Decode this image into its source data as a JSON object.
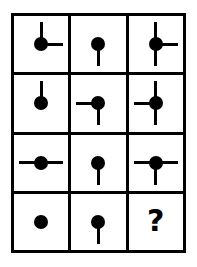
{
  "puzzle": {
    "type": "visual-analogy-matrix",
    "title": "Dot and line matrix puzzle",
    "rows": 4,
    "cols": 3,
    "border_color": "#000000",
    "background_color": "#ffffff",
    "stroke_color": "#000000",
    "missing_cell_symbol": "?",
    "cells": [
      {
        "id": "r1c1",
        "row": 1,
        "col": 1,
        "shape": "dot",
        "lines": [
          "up",
          "right"
        ],
        "label": ""
      },
      {
        "id": "r1c2",
        "row": 1,
        "col": 2,
        "shape": "dot",
        "lines": [
          "down"
        ],
        "label": ""
      },
      {
        "id": "r1c3",
        "row": 1,
        "col": 3,
        "shape": "dot",
        "lines": [
          "up",
          "down",
          "right"
        ],
        "label": ""
      },
      {
        "id": "r2c1",
        "row": 2,
        "col": 1,
        "shape": "dot",
        "lines": [
          "up"
        ],
        "label": ""
      },
      {
        "id": "r2c2",
        "row": 2,
        "col": 2,
        "shape": "dot",
        "lines": [
          "left",
          "down"
        ],
        "label": ""
      },
      {
        "id": "r2c3",
        "row": 2,
        "col": 3,
        "shape": "dot",
        "lines": [
          "up",
          "down",
          "left"
        ],
        "label": ""
      },
      {
        "id": "r3c1",
        "row": 3,
        "col": 1,
        "shape": "dot",
        "lines": [
          "left",
          "right"
        ],
        "label": ""
      },
      {
        "id": "r3c2",
        "row": 3,
        "col": 2,
        "shape": "dot",
        "lines": [
          "down"
        ],
        "label": ""
      },
      {
        "id": "r3c3",
        "row": 3,
        "col": 3,
        "shape": "dot",
        "lines": [
          "left",
          "right",
          "down"
        ],
        "label": ""
      },
      {
        "id": "r4c1",
        "row": 4,
        "col": 1,
        "shape": "dot",
        "lines": [],
        "label": ""
      },
      {
        "id": "r4c2",
        "row": 4,
        "col": 2,
        "shape": "dot",
        "lines": [
          "down"
        ],
        "label": ""
      },
      {
        "id": "r4c3",
        "row": 4,
        "col": 3,
        "shape": "question",
        "lines": [],
        "label": "?"
      }
    ]
  }
}
